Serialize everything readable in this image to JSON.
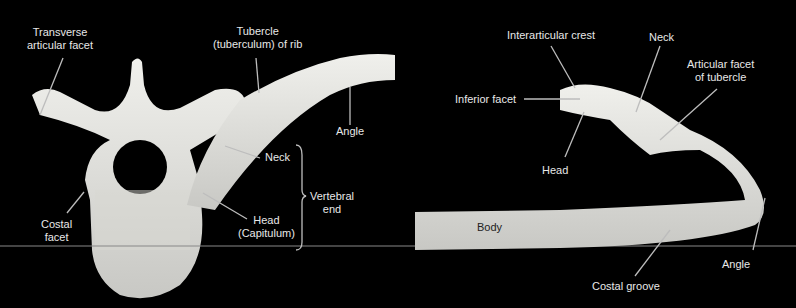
{
  "left_panel": {
    "labels": {
      "transverse_articular_facet": [
        "Transverse",
        "articular facet"
      ],
      "tubercle": [
        "Tubercle",
        "(tuberculum) of rib"
      ],
      "angle": "Angle",
      "neck": "Neck",
      "vertebral_end": [
        "Vertebral",
        "end"
      ],
      "costal_facet": [
        "Costal",
        "facet"
      ],
      "head": [
        "Head",
        "(Capitulum)"
      ]
    }
  },
  "right_panel": {
    "labels": {
      "interarticular_crest": "Interarticular crest",
      "neck": "Neck",
      "articular_facet_of_tubercle": [
        "Articular facet",
        "of tubercle"
      ],
      "inferior_facet": "Inferior facet",
      "head": "Head",
      "body": "Body",
      "angle": "Angle",
      "costal_groove": "Costal groove"
    }
  },
  "colors": {
    "background": "#000000",
    "bone": "#e4e4e0",
    "label": "#e8e8e8",
    "leader": "#bdbdbd"
  }
}
